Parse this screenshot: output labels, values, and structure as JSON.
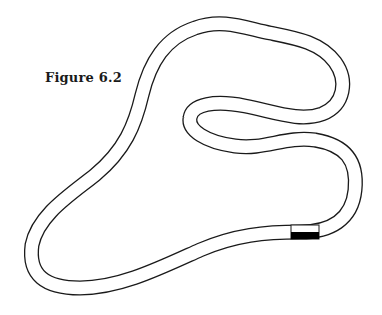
{
  "figure": {
    "caption": "Figure 6.2",
    "colors": {
      "background": "#ffffff",
      "outline": "#1a1a1a",
      "road_fill": "#ffffff",
      "marker": "#000000"
    },
    "track": {
      "start_marker": {
        "label": "start-finish-box"
      }
    }
  }
}
